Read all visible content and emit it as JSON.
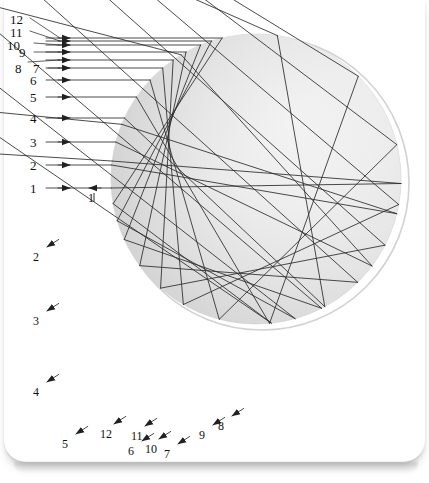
{
  "figure": {
    "type": "optics-ray-diagram",
    "background_color": "#ffffff",
    "page_card_color": "#ffffff",
    "ray_color": "#2b2b2b",
    "sphere": {
      "name": "water-droplet-sphere",
      "center_x": 256,
      "center_y": 179,
      "radius": 145,
      "fill_light": "#f4f4f4",
      "fill_dark": "#b9b9b9",
      "outline_color": "#cfcfcf"
    },
    "axis_y": 188,
    "incoming_rays": [
      {
        "id": "1",
        "label": "1",
        "y": 188,
        "label_x": 30,
        "label_y": 182,
        "impact_y": 188
      },
      {
        "id": "2",
        "label": "2",
        "y": 165,
        "label_x": 30,
        "label_y": 159,
        "impact_y": 165
      },
      {
        "id": "3",
        "label": "3",
        "y": 142,
        "label_x": 30,
        "label_y": 136,
        "impact_y": 142
      },
      {
        "id": "4",
        "label": "4",
        "y": 118,
        "label_x": 30,
        "label_y": 112,
        "impact_y": 118
      },
      {
        "id": "5",
        "label": "5",
        "y": 97,
        "label_x": 30,
        "label_y": 91,
        "impact_y": 97
      },
      {
        "id": "6",
        "label": "6",
        "y": 80,
        "label_x": 30,
        "label_y": 74,
        "impact_y": 80
      },
      {
        "id": "7",
        "label": "7",
        "y": 68,
        "label_x": 33,
        "label_y": 62,
        "impact_y": 68
      },
      {
        "id": "8",
        "label": "8",
        "y": 60,
        "label_x": 15,
        "label_y": 62,
        "impact_y": 60
      },
      {
        "id": "9",
        "label": "9",
        "y": 52,
        "label_x": 19,
        "label_y": 46,
        "impact_y": 52
      },
      {
        "id": "10",
        "label": "10",
        "y": 45,
        "label_x": 7,
        "label_y": 39,
        "impact_y": 45
      },
      {
        "id": "11",
        "label": "11",
        "y": 41,
        "label_x": 10,
        "label_y": 26,
        "impact_y": 41
      },
      {
        "id": "12",
        "label": "12",
        "y": 38,
        "label_x": 10,
        "label_y": 13,
        "impact_y": 38
      }
    ],
    "exit_labels": [
      {
        "id": "1",
        "label": "1",
        "x": 88,
        "y": 192
      },
      {
        "id": "2",
        "label": "2",
        "x": 33,
        "y": 251
      },
      {
        "id": "3",
        "label": "3",
        "x": 33,
        "y": 315
      },
      {
        "id": "4",
        "label": "4",
        "x": 33,
        "y": 386
      },
      {
        "id": "5",
        "label": "5",
        "x": 62,
        "y": 438
      },
      {
        "id": "6",
        "label": "6",
        "x": 128,
        "y": 445
      },
      {
        "id": "7",
        "label": "7",
        "x": 164,
        "y": 448
      },
      {
        "id": "8",
        "label": "8",
        "x": 218,
        "y": 420
      },
      {
        "id": "9",
        "label": "9",
        "x": 199,
        "y": 429
      },
      {
        "id": "10",
        "label": "10",
        "x": 145,
        "y": 443
      },
      {
        "id": "11",
        "label": "11",
        "x": 131,
        "y": 430
      },
      {
        "id": "12",
        "label": "12",
        "x": 100,
        "y": 428
      }
    ],
    "incoming_arrow_x": 70,
    "ray_start_x": 46
  }
}
